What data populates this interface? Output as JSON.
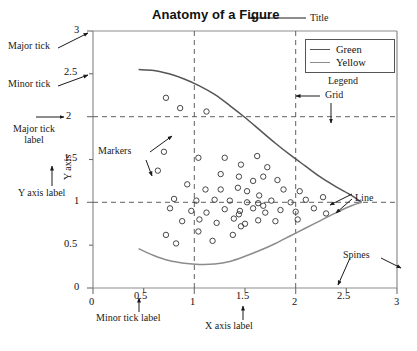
{
  "figure": {
    "title": "Anatomy of a Figure",
    "background": "#ffffff",
    "axes_color": "#808080",
    "grid_color": "#555555"
  },
  "legend": {
    "entries": [
      {
        "label": "Green",
        "color": "#555555"
      },
      {
        "label": "Yellow",
        "color": "#8c8c8c"
      }
    ],
    "caption": "Legend"
  },
  "annotations": {
    "title": "Title",
    "major_tick": "Major tick",
    "minor_tick": "Minor tick",
    "major_tick_label_line1": "Major tick",
    "major_tick_label_line2": "label",
    "y_axis_label_text": "Y axis",
    "y_axis_label": "Y axis label",
    "markers": "Markers",
    "grid": "Grid",
    "legend": "Legend",
    "line": "Line",
    "spines": "Spines",
    "minor_tick_label": "Minor tick label",
    "x_axis_label": "X axis label"
  },
  "chart_data": {
    "type": "scatter",
    "title": "Anatomy of a Figure",
    "xlabel": "X axis label",
    "ylabel": "Y axis",
    "xlim": [
      0,
      3
    ],
    "ylim": [
      0,
      3
    ],
    "grid": true,
    "legend_position": "upper right",
    "x_major_ticks": [
      0,
      1,
      2,
      3
    ],
    "x_minor_ticks": [
      0.5,
      1.5,
      2.5
    ],
    "x_tick_labels": [
      "0",
      "0.5",
      "1",
      "1.5",
      "2",
      "2.5",
      "3"
    ],
    "x_tick_values": [
      0,
      0.5,
      1,
      1.5,
      2,
      2.5,
      3
    ],
    "y_major_ticks": [
      0,
      1,
      2,
      3
    ],
    "y_minor_ticks": [
      0.5,
      1.5,
      2.5
    ],
    "y_tick_labels": [
      "0",
      "0.5",
      "1",
      "1.5",
      "2",
      "2.5",
      "3"
    ],
    "y_tick_values": [
      0,
      0.5,
      1,
      1.5,
      2,
      2.5,
      3
    ],
    "series": [
      {
        "name": "Green",
        "type": "line",
        "color": "#555555",
        "points": [
          [
            0.45,
            2.55
          ],
          [
            0.6,
            2.54
          ],
          [
            0.75,
            2.5
          ],
          [
            0.9,
            2.44
          ],
          [
            1.05,
            2.36
          ],
          [
            1.2,
            2.26
          ],
          [
            1.35,
            2.13
          ],
          [
            1.5,
            1.99
          ],
          [
            1.65,
            1.84
          ],
          [
            1.8,
            1.69
          ],
          [
            1.95,
            1.55
          ],
          [
            2.1,
            1.42
          ],
          [
            2.25,
            1.29
          ],
          [
            2.4,
            1.18
          ],
          [
            2.55,
            1.08
          ],
          [
            2.65,
            1.0
          ]
        ]
      },
      {
        "name": "Yellow",
        "type": "line",
        "color": "#8c8c8c",
        "points": [
          [
            0.45,
            0.46
          ],
          [
            0.6,
            0.38
          ],
          [
            0.75,
            0.32
          ],
          [
            0.9,
            0.29
          ],
          [
            1.05,
            0.275
          ],
          [
            1.2,
            0.28
          ],
          [
            1.35,
            0.31
          ],
          [
            1.5,
            0.37
          ],
          [
            1.65,
            0.44
          ],
          [
            1.8,
            0.52
          ],
          [
            1.95,
            0.61
          ],
          [
            2.1,
            0.7
          ],
          [
            2.25,
            0.79
          ],
          [
            2.4,
            0.88
          ],
          [
            2.55,
            0.96
          ],
          [
            2.65,
            1.0
          ]
        ]
      },
      {
        "name": "markers",
        "type": "scatter",
        "marker": "o",
        "color": "#333333",
        "points": [
          [
            0.72,
            2.22
          ],
          [
            0.86,
            2.1
          ],
          [
            1.12,
            2.06
          ],
          [
            0.7,
            1.59
          ],
          [
            0.64,
            1.37
          ],
          [
            1.04,
            1.52
          ],
          [
            1.3,
            1.52
          ],
          [
            1.46,
            1.44
          ],
          [
            1.62,
            1.54
          ],
          [
            1.72,
            1.41
          ],
          [
            1.26,
            1.33
          ],
          [
            1.44,
            1.3
          ],
          [
            1.58,
            1.25
          ],
          [
            1.68,
            1.3
          ],
          [
            1.82,
            1.26
          ],
          [
            0.93,
            1.21
          ],
          [
            1.11,
            1.15
          ],
          [
            1.26,
            1.15
          ],
          [
            1.43,
            1.17
          ],
          [
            1.52,
            1.13
          ],
          [
            1.64,
            1.08
          ],
          [
            1.88,
            1.15
          ],
          [
            2.04,
            1.13
          ],
          [
            0.8,
            1.04
          ],
          [
            1.02,
            1.02
          ],
          [
            1.2,
            1.03
          ],
          [
            1.35,
            1.02
          ],
          [
            1.52,
            1.0
          ],
          [
            1.63,
            0.99
          ],
          [
            1.68,
            0.96
          ],
          [
            1.76,
            1.02
          ],
          [
            1.95,
            1.0
          ],
          [
            2.1,
            1.03
          ],
          [
            2.27,
            1.06
          ],
          [
            0.76,
            0.93
          ],
          [
            0.97,
            0.9
          ],
          [
            1.12,
            0.88
          ],
          [
            1.3,
            0.92
          ],
          [
            1.45,
            0.9
          ],
          [
            1.58,
            0.93
          ],
          [
            1.44,
            0.86
          ],
          [
            1.7,
            0.88
          ],
          [
            1.85,
            0.91
          ],
          [
            2.0,
            0.89
          ],
          [
            2.18,
            0.93
          ],
          [
            2.3,
            0.87
          ],
          [
            0.88,
            0.78
          ],
          [
            1.05,
            0.8
          ],
          [
            1.22,
            0.76
          ],
          [
            1.39,
            0.81
          ],
          [
            1.5,
            0.75
          ],
          [
            1.63,
            0.79
          ],
          [
            1.8,
            0.78
          ],
          [
            2.02,
            0.8
          ],
          [
            0.72,
            0.62
          ],
          [
            0.82,
            0.52
          ],
          [
            1.04,
            0.66
          ],
          [
            1.18,
            0.55
          ],
          [
            1.38,
            0.62
          ],
          [
            1.46,
            0.72
          ]
        ]
      }
    ]
  }
}
